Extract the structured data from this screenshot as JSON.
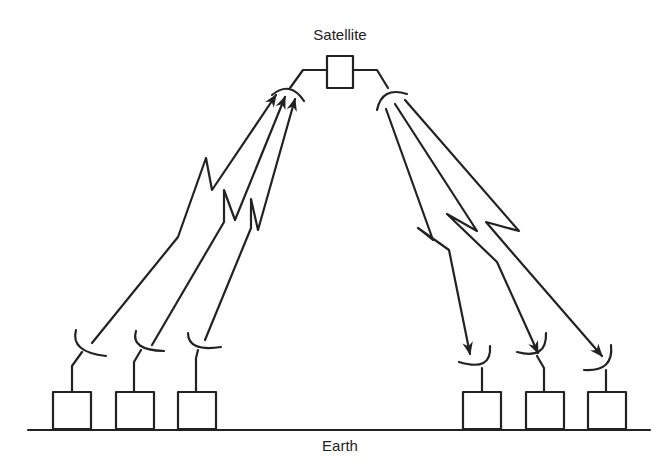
{
  "labels": {
    "satellite": "Satellite",
    "earth": "Earth"
  },
  "colors": {
    "stroke": "#222222",
    "background": "#ffffff"
  },
  "satellite": {
    "box": [
      327,
      56,
      26,
      32
    ]
  },
  "uplink_stations": [
    {
      "box": [
        53,
        392,
        38,
        37
      ]
    },
    {
      "box": [
        116,
        392,
        38,
        37
      ]
    },
    {
      "box": [
        178,
        392,
        38,
        37
      ]
    }
  ],
  "downlink_stations": [
    {
      "box": [
        463,
        392,
        38,
        37
      ]
    },
    {
      "box": [
        526,
        392,
        38,
        37
      ]
    },
    {
      "box": [
        588,
        392,
        38,
        37
      ]
    }
  ],
  "earth_line": [
    28,
    430,
    650,
    430
  ]
}
